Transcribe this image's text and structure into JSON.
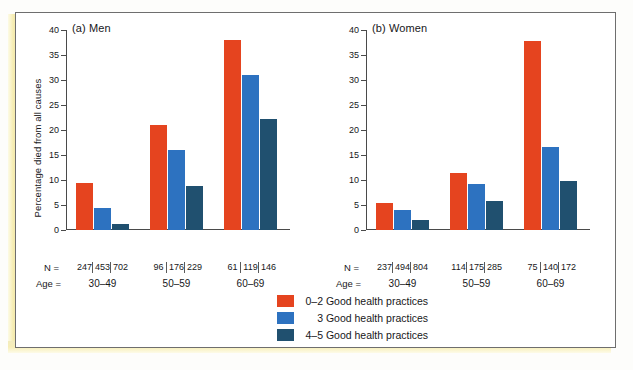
{
  "figure": {
    "background_color": "#ffffff",
    "frame_color": "#6e6e6e",
    "band_color": "#f2e9ad"
  },
  "colors": {
    "red": "#e5441f",
    "blue": "#2d72c0",
    "navy": "#20506f",
    "axis": "#4a4a4a",
    "text": "#17171a"
  },
  "labels": {
    "ylabel": "Percentage died from all causes",
    "n_equals": "N =",
    "age_equals": "Age ="
  },
  "legend": {
    "items": [
      {
        "label": "0–2 Good health practices",
        "count": "0–2",
        "rest": "Good health practices",
        "color": "#e5441f",
        "swatch_name": "legend-swatch-red"
      },
      {
        "label": "3 Good health practices",
        "count": "3",
        "rest": "Good health practices",
        "color": "#2d72c0",
        "swatch_name": "legend-swatch-blue"
      },
      {
        "label": "4–5 Good health practices",
        "count": "4–5",
        "rest": "Good health practices",
        "color": "#20506f",
        "swatch_name": "legend-swatch-navy"
      }
    ]
  },
  "axis": {
    "ticks": [
      "40",
      "35",
      "30",
      "25",
      "20",
      "15",
      "10",
      "5",
      "0"
    ],
    "min": 0,
    "max": 40,
    "step": 5
  },
  "panels": {
    "men": {
      "title": "(a) Men",
      "categories": [
        "30–49",
        "50–59",
        "60–69"
      ],
      "n_values": [
        [
          "247",
          "453",
          "702"
        ],
        [
          "96",
          "176",
          "229"
        ],
        [
          "61",
          "119",
          "146"
        ]
      ]
    },
    "women": {
      "title": "(b) Women",
      "categories": [
        "30–49",
        "50–59",
        "60–69"
      ],
      "n_values": [
        [
          "237",
          "494",
          "804"
        ],
        [
          "114",
          "175",
          "285"
        ],
        [
          "75",
          "140",
          "172"
        ]
      ]
    }
  },
  "chart_data": [
    {
      "type": "bar",
      "title": "(a) Men",
      "xlabel": "Age =",
      "ylabel": "Percentage died from all causes",
      "categories": [
        "30–49",
        "50–59",
        "60–69"
      ],
      "ylim": [
        0,
        40
      ],
      "yticks": [
        0,
        5,
        10,
        15,
        20,
        25,
        30,
        35,
        40
      ],
      "grid": false,
      "legend_position": "bottom-center",
      "series": [
        {
          "name": "0–2 Good health practices",
          "color": "#e5441f",
          "values": [
            9.5,
            21.0,
            38.0
          ]
        },
        {
          "name": "3 Good health practices",
          "color": "#2d72c0",
          "values": [
            4.4,
            16.0,
            31.0
          ]
        },
        {
          "name": "4–5 Good health practices",
          "color": "#20506f",
          "values": [
            1.2,
            8.8,
            22.2
          ]
        }
      ],
      "n_counts": {
        "30–49": [
          247,
          453,
          702
        ],
        "50–59": [
          96,
          176,
          229
        ],
        "60–69": [
          61,
          119,
          146
        ]
      }
    },
    {
      "type": "bar",
      "title": "(b) Women",
      "xlabel": "Age =",
      "ylabel": "",
      "categories": [
        "30–49",
        "50–59",
        "60–69"
      ],
      "ylim": [
        0,
        40
      ],
      "yticks": [
        0,
        5,
        10,
        15,
        20,
        25,
        30,
        35,
        40
      ],
      "grid": false,
      "legend_position": "bottom-center",
      "series": [
        {
          "name": "0–2 Good health practices",
          "color": "#e5441f",
          "values": [
            5.5,
            11.5,
            37.8
          ]
        },
        {
          "name": "3 Good health practices",
          "color": "#2d72c0",
          "values": [
            4.0,
            9.2,
            16.7
          ]
        },
        {
          "name": "4–5 Good health practices",
          "color": "#20506f",
          "values": [
            2.0,
            5.8,
            9.8
          ]
        }
      ],
      "n_counts": {
        "30–49": [
          237,
          494,
          804
        ],
        "50–59": [
          114,
          175,
          285
        ],
        "60–69": [
          75,
          140,
          172
        ]
      }
    }
  ]
}
